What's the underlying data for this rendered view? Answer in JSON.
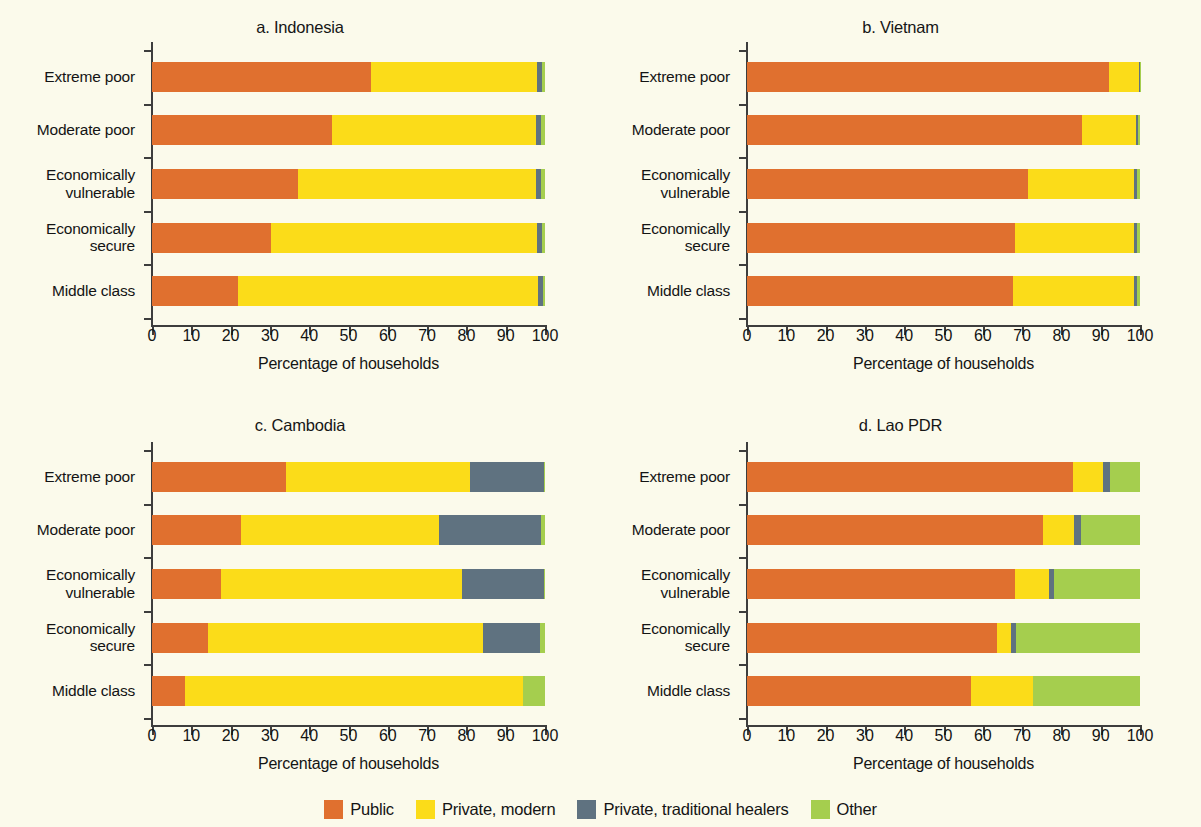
{
  "figure": {
    "background_color": "#fbfaeb",
    "axis_title": "Percentage of households",
    "categories": [
      "Extreme poor",
      "Moderate poor",
      "Economically\nvulnerable",
      "Economically\nsecure",
      "Middle class"
    ],
    "x_ticks": [
      "0",
      "10",
      "20",
      "30",
      "40",
      "50",
      "60",
      "70",
      "80",
      "90",
      "100"
    ]
  },
  "legend": {
    "position": "bottom-center",
    "items": [
      {
        "label": "Public",
        "color": "#e0702f"
      },
      {
        "label": "Private, modern",
        "color": "#fbdc19"
      },
      {
        "label": "Private, traditional healers",
        "color": "#5f7280"
      },
      {
        "label": "Other",
        "color": "#a5ce4e"
      }
    ]
  },
  "chart_data": [
    {
      "type": "bar",
      "orientation": "horizontal",
      "stacked": true,
      "title": "a. Indonesia",
      "xlabel": "Percentage of households",
      "ylabel": "",
      "xlim": [
        0,
        100
      ],
      "grid": false,
      "legend_position": "figure-bottom",
      "categories": [
        "Extreme poor",
        "Moderate poor",
        "Economically vulnerable",
        "Economically secure",
        "Middle class"
      ],
      "series": [
        {
          "name": "Public",
          "color": "#e0702f",
          "values": [
            55.8,
            45.8,
            37.2,
            30.2,
            21.8
          ]
        },
        {
          "name": "Private, modern",
          "color": "#fbdc19",
          "values": [
            42.2,
            52.0,
            60.6,
            67.7,
            76.4
          ]
        },
        {
          "name": "Private, traditional healers",
          "color": "#5f7280",
          "values": [
            1.3,
            1.2,
            1.3,
            1.3,
            1.4
          ]
        },
        {
          "name": "Other",
          "color": "#a5ce4e",
          "values": [
            0.7,
            1.0,
            0.9,
            0.8,
            0.4
          ]
        }
      ]
    },
    {
      "type": "bar",
      "orientation": "horizontal",
      "stacked": true,
      "title": "b. Vietnam",
      "xlabel": "Percentage of households",
      "ylabel": "",
      "xlim": [
        0,
        100
      ],
      "grid": false,
      "legend_position": "figure-bottom",
      "categories": [
        "Extreme poor",
        "Moderate poor",
        "Economically vulnerable",
        "Economically secure",
        "Middle class"
      ],
      "series": [
        {
          "name": "Public",
          "color": "#e0702f",
          "values": [
            92.0,
            85.3,
            71.6,
            68.2,
            67.6
          ]
        },
        {
          "name": "Private, modern",
          "color": "#fbdc19",
          "values": [
            7.7,
            13.6,
            27.0,
            30.3,
            30.8
          ]
        },
        {
          "name": "Private, traditional healers",
          "color": "#5f7280",
          "values": [
            0.2,
            0.6,
            0.7,
            0.7,
            0.8
          ]
        },
        {
          "name": "Other",
          "color": "#a5ce4e",
          "values": [
            0.1,
            0.5,
            0.7,
            0.8,
            0.8
          ]
        }
      ]
    },
    {
      "type": "bar",
      "orientation": "horizontal",
      "stacked": true,
      "title": "c. Cambodia",
      "xlabel": "Percentage of households",
      "ylabel": "",
      "xlim": [
        0,
        100
      ],
      "grid": false,
      "legend_position": "figure-bottom",
      "categories": [
        "Extreme poor",
        "Moderate poor",
        "Economically vulnerable",
        "Economically secure",
        "Middle class"
      ],
      "series": [
        {
          "name": "Public",
          "color": "#e0702f",
          "values": [
            34.1,
            22.6,
            17.5,
            14.3,
            8.5
          ]
        },
        {
          "name": "Private, modern",
          "color": "#fbdc19",
          "values": [
            46.9,
            50.5,
            61.3,
            69.9,
            85.8
          ]
        },
        {
          "name": "Private, traditional healers",
          "color": "#5f7280",
          "values": [
            18.8,
            25.8,
            21.0,
            14.5,
            0.0
          ]
        },
        {
          "name": "Other",
          "color": "#a5ce4e",
          "values": [
            0.2,
            1.1,
            0.2,
            1.3,
            5.7
          ]
        }
      ]
    },
    {
      "type": "bar",
      "orientation": "horizontal",
      "stacked": true,
      "title": "d. Lao PDR",
      "xlabel": "Percentage of households",
      "ylabel": "",
      "xlim": [
        0,
        100
      ],
      "grid": false,
      "legend_position": "figure-bottom",
      "categories": [
        "Extreme poor",
        "Moderate poor",
        "Economically vulnerable",
        "Economically secure",
        "Middle class"
      ],
      "series": [
        {
          "name": "Public",
          "color": "#e0702f",
          "values": [
            83.0,
            75.3,
            68.2,
            63.5,
            57.0
          ]
        },
        {
          "name": "Private, modern",
          "color": "#fbdc19",
          "values": [
            7.6,
            7.9,
            8.7,
            3.7,
            15.7
          ]
        },
        {
          "name": "Private, traditional healers",
          "color": "#5f7280",
          "values": [
            1.8,
            1.8,
            1.2,
            1.3,
            0.0
          ]
        },
        {
          "name": "Other",
          "color": "#a5ce4e",
          "values": [
            7.6,
            15.0,
            21.9,
            31.5,
            27.3
          ]
        }
      ]
    }
  ]
}
